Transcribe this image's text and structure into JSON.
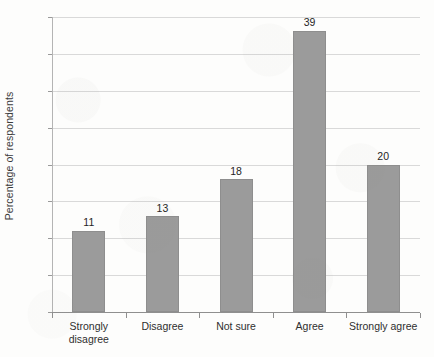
{
  "chart_data": {
    "type": "bar",
    "title": "",
    "xlabel": "",
    "ylabel": "Percentage of respondents",
    "categories": [
      "Strongly disagree",
      "Disagree",
      "Not sure",
      "Agree",
      "Strongly agree"
    ],
    "values": [
      11,
      13,
      18,
      39,
      20
    ],
    "value_labels": [
      "11",
      "13",
      "18",
      "39",
      "20"
    ],
    "ylim": [
      0,
      40
    ],
    "ytick_step": 5,
    "ytick_labels": [
      "0",
      "5",
      "10",
      "15",
      "20",
      "25",
      "30",
      "35",
      "40"
    ],
    "grid": "horizontal",
    "legend": "none",
    "bar_color": "#9b9b9b",
    "gridline_color": "#d9d9d9",
    "axis_color": "#8f8f8f",
    "background_color": "#fdfdfc"
  }
}
